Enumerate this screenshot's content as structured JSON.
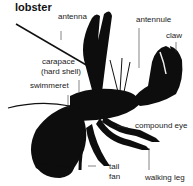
{
  "diagram": {
    "title": "lobster",
    "labels": {
      "antenna": "antenna",
      "antennule": "antennule",
      "claw": "claw",
      "carapace_line1": "carapace",
      "carapace_line2": "(hard shell)",
      "swimmeret": "swimmeret",
      "compound_eye": "compound eye",
      "tail_line1": "tail",
      "tail_line2": "fan",
      "walking_leg": "walking leg"
    },
    "colors": {
      "body": "#0d0d0d",
      "leader_line": "#333333",
      "text": "#222222"
    }
  }
}
